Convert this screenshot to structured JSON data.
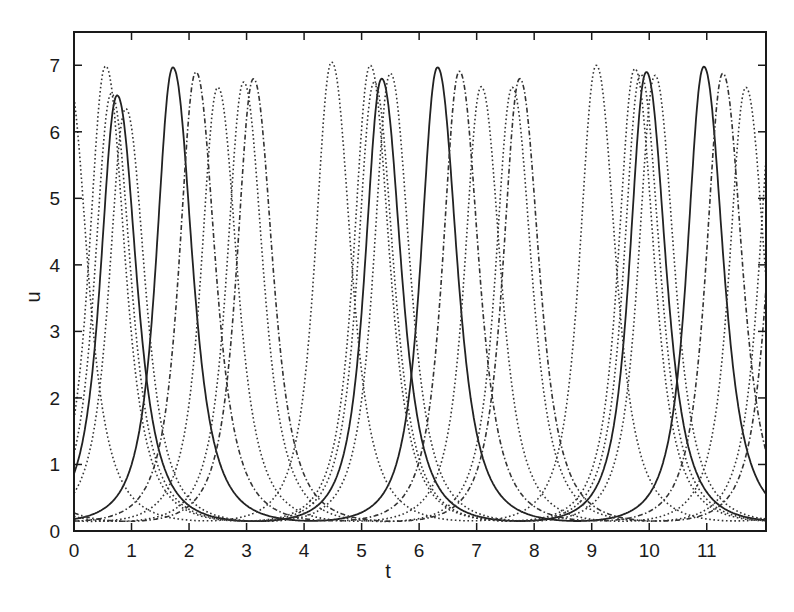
{
  "chart_data": {
    "type": "line",
    "title": "",
    "xlabel": "t",
    "ylabel": "u",
    "xlim": [
      0,
      12.03
    ],
    "ylim": [
      0,
      7.5
    ],
    "xticks": [
      0,
      1,
      2,
      3,
      4,
      5,
      6,
      7,
      8,
      9,
      10,
      11
    ],
    "yticks": [
      0,
      1,
      2,
      3,
      4,
      5,
      6,
      7
    ],
    "grid": false,
    "legend": null,
    "period": 4.6,
    "baseline": 0.03,
    "series": [
      {
        "name": "u1",
        "style": "solid",
        "peaks": [
          [
            0.75,
            6.5
          ],
          [
            5.35,
            6.75
          ],
          [
            9.95,
            6.85
          ]
        ]
      },
      {
        "name": "u2",
        "style": "solid",
        "peaks": [
          [
            1.72,
            6.92
          ],
          [
            6.32,
            6.92
          ],
          [
            10.95,
            6.93
          ]
        ]
      },
      {
        "name": "u3",
        "style": "dotted",
        "peaks": [
          [
            -0.1,
            6.76
          ],
          [
            4.48,
            7.0
          ],
          [
            9.08,
            6.95
          ]
        ]
      },
      {
        "name": "u4",
        "style": "dotted",
        "peaks": [
          [
            0.65,
            6.53
          ],
          [
            5.22,
            6.7
          ],
          [
            9.85,
            6.82
          ]
        ]
      },
      {
        "name": "u5",
        "style": "dashdot",
        "peaks": [
          [
            2.12,
            6.85
          ],
          [
            6.7,
            6.86
          ],
          [
            11.28,
            6.83
          ]
        ]
      },
      {
        "name": "u6",
        "style": "dotted",
        "peaks": [
          [
            2.5,
            6.62
          ],
          [
            7.08,
            6.63
          ],
          [
            11.68,
            6.62
          ]
        ]
      },
      {
        "name": "u7",
        "style": "dotted",
        "peaks": [
          [
            2.95,
            6.7
          ],
          [
            7.62,
            6.62
          ],
          [
            12.2,
            6.7
          ]
        ]
      },
      {
        "name": "u8",
        "style": "dashdot",
        "peaks": [
          [
            3.12,
            6.75
          ],
          [
            7.75,
            6.75
          ],
          [
            12.35,
            6.75
          ]
        ]
      },
      {
        "name": "u9",
        "style": "dotted",
        "peaks": [
          [
            5.15,
            6.95
          ],
          [
            9.75,
            6.9
          ]
        ]
      },
      {
        "name": "u10",
        "style": "dotted",
        "peaks": [
          [
            0.9,
            6.3
          ],
          [
            5.5,
            6.83
          ],
          [
            10.1,
            6.8
          ]
        ]
      }
    ]
  }
}
